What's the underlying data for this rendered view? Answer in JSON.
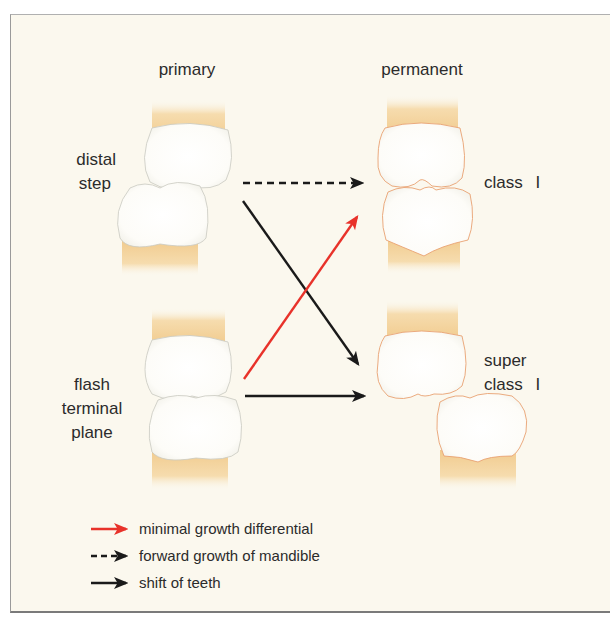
{
  "figure": {
    "columns": {
      "left_title": "primary",
      "right_title": "permanent"
    },
    "rows": [
      {
        "primary_label_lines": [
          "distal",
          "step"
        ],
        "permanent_label_lines": [
          "class I"
        ]
      },
      {
        "primary_label_lines": [
          "flash",
          "terminal",
          "plane"
        ],
        "permanent_label_lines": [
          "super",
          "class I"
        ]
      }
    ],
    "transitions": [
      {
        "from": "distal step",
        "to": "class I",
        "style": "dashed",
        "color": "#1a1a1a",
        "meaning": "forward growth of mandible"
      },
      {
        "from": "distal step",
        "to": "super class I",
        "style": "solid",
        "color": "#1a1a1a",
        "meaning": "shift of teeth"
      },
      {
        "from": "flash terminal plane",
        "to": "class I",
        "style": "solid",
        "color": "#e8322a",
        "meaning": "minimal growth differential"
      },
      {
        "from": "flash terminal plane",
        "to": "super class I",
        "style": "solid",
        "color": "#1a1a1a",
        "meaning": "shift of teeth"
      }
    ],
    "legend": [
      {
        "label": "minimal growth differential",
        "style": "solid",
        "color": "#e8322a"
      },
      {
        "label": "forward growth of mandible",
        "style": "dashed",
        "color": "#1a1a1a"
      },
      {
        "label": "shift of teeth",
        "style": "solid",
        "color": "#1a1a1a"
      }
    ],
    "colors": {
      "background": "#fbf8ee",
      "enamel": "#ffffff",
      "root": "#f3d29c",
      "primary_outline": "#c9c9c0",
      "permanent_outline": "#e9a272",
      "red_arrow": "#e8322a",
      "black_arrow": "#1a1a1a"
    }
  }
}
